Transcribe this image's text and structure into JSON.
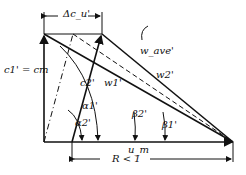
{
  "diagram": {
    "labels": {
      "delta_cu": "Δc_u'",
      "c1_eq_cm": "c1' = cm",
      "c2": "c2'",
      "w1": "w1'",
      "w_ave": "w_ave'",
      "w2": "w2'",
      "alpha1": "α1'",
      "alpha2": "α2'",
      "beta1": "β1'",
      "beta2": "β2'",
      "um": "u_m",
      "reaction": "R < 1"
    },
    "line_color": "#111111"
  }
}
